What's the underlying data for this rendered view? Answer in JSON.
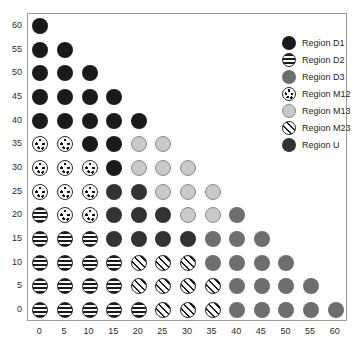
{
  "chart_data": {
    "type": "scatter",
    "title": "",
    "xlabel": "",
    "ylabel": "",
    "xlim": [
      -2.5,
      62.5
    ],
    "ylim": [
      -2.5,
      62.5
    ],
    "grid": false,
    "legend_position": "top-right",
    "x_ticks": [
      0,
      5,
      10,
      15,
      20,
      25,
      30,
      35,
      40,
      45,
      50,
      55,
      60
    ],
    "y_ticks": [
      0,
      5,
      10,
      15,
      20,
      25,
      30,
      35,
      40,
      45,
      50,
      55,
      60
    ],
    "categories": [
      "D1",
      "D2",
      "D3",
      "M12",
      "M13",
      "M23",
      "U"
    ],
    "series": [
      {
        "name": "Region D1",
        "key": "D1",
        "marker": "solid-black-circle",
        "color": "#1a1a1a",
        "points": [
          [
            0,
            60
          ],
          [
            0,
            55
          ],
          [
            5,
            55
          ],
          [
            0,
            50
          ],
          [
            5,
            50
          ],
          [
            10,
            50
          ],
          [
            0,
            45
          ],
          [
            5,
            45
          ],
          [
            10,
            45
          ],
          [
            15,
            45
          ],
          [
            0,
            40
          ],
          [
            5,
            40
          ],
          [
            10,
            40
          ],
          [
            15,
            40
          ],
          [
            20,
            40
          ],
          [
            10,
            35
          ],
          [
            15,
            35
          ],
          [
            15,
            30
          ]
        ]
      },
      {
        "name": "Region D2",
        "key": "D2",
        "marker": "horizontal-striped-circle",
        "color": "#1a1a1a",
        "points": [
          [
            0,
            20
          ],
          [
            0,
            15
          ],
          [
            5,
            15
          ],
          [
            10,
            15
          ],
          [
            0,
            10
          ],
          [
            5,
            10
          ],
          [
            10,
            10
          ],
          [
            15,
            10
          ],
          [
            0,
            5
          ],
          [
            5,
            5
          ],
          [
            10,
            5
          ],
          [
            15,
            5
          ],
          [
            0,
            0
          ],
          [
            5,
            0
          ],
          [
            10,
            0
          ],
          [
            15,
            0
          ],
          [
            20,
            0
          ]
        ]
      },
      {
        "name": "Region D3",
        "key": "D3",
        "marker": "solid-gray-circle",
        "color": "#6e6e6e",
        "points": [
          [
            40,
            20
          ],
          [
            35,
            15
          ],
          [
            40,
            15
          ],
          [
            45,
            15
          ],
          [
            35,
            10
          ],
          [
            40,
            10
          ],
          [
            45,
            10
          ],
          [
            50,
            10
          ],
          [
            40,
            5
          ],
          [
            45,
            5
          ],
          [
            50,
            5
          ],
          [
            55,
            5
          ],
          [
            40,
            0
          ],
          [
            45,
            0
          ],
          [
            50,
            0
          ],
          [
            55,
            0
          ],
          [
            60,
            0
          ]
        ]
      },
      {
        "name": "Region M12",
        "key": "M12",
        "marker": "white-dotted-circle",
        "color": "#ffffff",
        "points": [
          [
            0,
            35
          ],
          [
            5,
            35
          ],
          [
            0,
            30
          ],
          [
            5,
            30
          ],
          [
            10,
            30
          ],
          [
            0,
            25
          ],
          [
            5,
            25
          ],
          [
            10,
            25
          ],
          [
            5,
            20
          ],
          [
            10,
            20
          ]
        ]
      },
      {
        "name": "Region M13",
        "key": "M13",
        "marker": "light-gray-circle",
        "color": "#c9c9c9",
        "points": [
          [
            20,
            35
          ],
          [
            25,
            35
          ],
          [
            20,
            30
          ],
          [
            25,
            30
          ],
          [
            30,
            30
          ],
          [
            25,
            25
          ],
          [
            30,
            25
          ],
          [
            35,
            25
          ],
          [
            30,
            20
          ],
          [
            35,
            20
          ]
        ]
      },
      {
        "name": "Region M23",
        "key": "M23",
        "marker": "diagonal-striped-circle",
        "color": "#1a1a1a",
        "points": [
          [
            20,
            10
          ],
          [
            25,
            10
          ],
          [
            30,
            10
          ],
          [
            20,
            5
          ],
          [
            25,
            5
          ],
          [
            30,
            5
          ],
          [
            35,
            5
          ],
          [
            25,
            0
          ],
          [
            30,
            0
          ],
          [
            35,
            0
          ]
        ]
      },
      {
        "name": "Region U",
        "key": "U",
        "marker": "solid-darkgray-circle",
        "color": "#333333",
        "points": [
          [
            15,
            25
          ],
          [
            20,
            25
          ],
          [
            15,
            20
          ],
          [
            20,
            20
          ],
          [
            25,
            20
          ],
          [
            15,
            15
          ],
          [
            20,
            15
          ],
          [
            25,
            15
          ],
          [
            30,
            15
          ]
        ]
      }
    ]
  },
  "legend": {
    "items": [
      {
        "label": "Region D1",
        "key": "D1"
      },
      {
        "label": "Region D2",
        "key": "D2"
      },
      {
        "label": "Region D3",
        "key": "D3"
      },
      {
        "label": "Region M12",
        "key": "M12"
      },
      {
        "label": "Region M13",
        "key": "M13"
      },
      {
        "label": "Region M23",
        "key": "M23"
      },
      {
        "label": "Region U",
        "key": "U"
      }
    ]
  }
}
